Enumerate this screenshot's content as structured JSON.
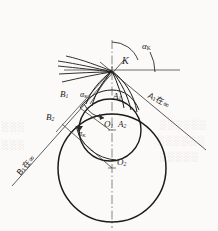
{
  "figure": {
    "type": "geometric-construction",
    "background_color": "#fbfaf8",
    "ink_color": "#1b1b1b"
  },
  "labels": {
    "point_k": "K",
    "alpha_k_top": "α",
    "alpha_k_top_sub": "K",
    "alpha_k_mid": "α",
    "alpha_k_mid_sub": "K",
    "alpha_k_low": "α",
    "alpha_k_low_sub": "K",
    "a1": "A",
    "a1_sub": "1",
    "a2": "A",
    "a2_sub": "2",
    "b1": "B",
    "b1_sub": "1",
    "b2": "B",
    "b2_sub": "2",
    "o1": "O",
    "o1_sub": "1",
    "o2": "O",
    "o2_sub": "2",
    "a1_at_infinity": "A₁在∞",
    "b1_at_infinity": "B₁在∞"
  },
  "geometry": {
    "tangent_point_k": {
      "x": 112,
      "y": 70
    },
    "small_circle": {
      "cx": 110,
      "cy": 130,
      "r": 31,
      "center_label": "O1"
    },
    "large_circle": {
      "cx": 112,
      "cy": 168,
      "r": 54,
      "center_label": "O2"
    },
    "axis_vertical": {
      "x": 112,
      "y1": 40,
      "y2": 228
    },
    "axis_horizontal": {
      "y": 70,
      "x1": 66,
      "x2": 178
    },
    "tangent_line_right": {
      "x1": 104,
      "y1": 62,
      "x2": 205,
      "y2": 148,
      "label": "A1-infinity"
    },
    "tangent_line_left": {
      "x1": 120,
      "y1": 62,
      "x2": 14,
      "y2": 182,
      "label": "B1-infinity"
    },
    "angle_alpha_k_degrees": 40
  },
  "bleedthrough": {
    "line1": "░░░░░",
    "line2": "░░░░░░",
    "line3": "░░░░░"
  }
}
